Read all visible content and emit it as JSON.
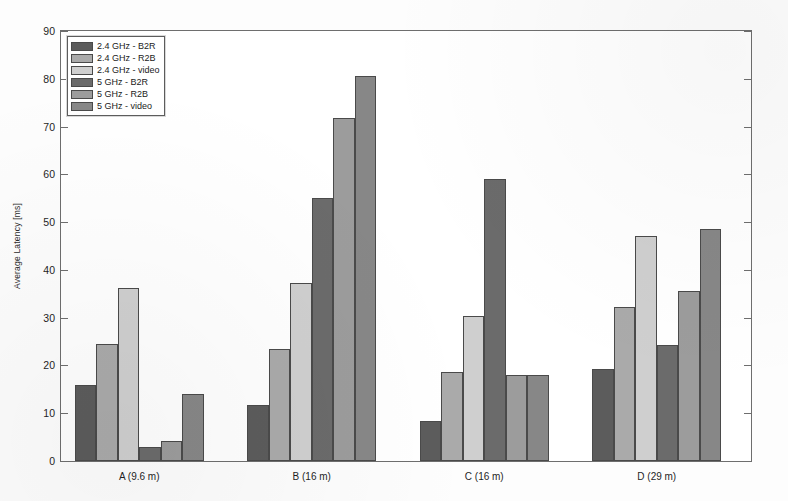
{
  "chart_data": {
    "type": "bar",
    "title": "",
    "xlabel": "",
    "ylabel": "Average Latency [ms]",
    "ylim": [
      0,
      90
    ],
    "yticks": [
      0,
      10,
      20,
      30,
      40,
      50,
      60,
      70,
      80,
      90
    ],
    "ytick_labels": [
      "0",
      "10",
      "20",
      "30",
      "40",
      "50",
      "60",
      "70",
      "80",
      "90"
    ],
    "grid": false,
    "legend_position": "upper left",
    "categories": [
      "A (9.6 m)",
      "B (16 m)",
      "C (16 m)",
      "D (29 m)"
    ],
    "series": [
      {
        "name": "2.4 GHz - B2R",
        "color": "#5c5c5c",
        "values": [
          16.0,
          11.7,
          8.3,
          19.2
        ]
      },
      {
        "name": "2.4 GHz - R2B",
        "color": "#aaaaaa",
        "values": [
          24.4,
          23.5,
          18.7,
          32.3
        ]
      },
      {
        "name": "2.4 GHz - video",
        "color": "#cfcfcf",
        "values": [
          36.2,
          37.3,
          30.3,
          47.0
        ]
      },
      {
        "name": "5 GHz - B2R",
        "color": "#6b6b6b",
        "values": [
          2.9,
          55.0,
          59.0,
          24.2
        ]
      },
      {
        "name": "5 GHz - R2B",
        "color": "#9c9c9c",
        "values": [
          4.1,
          71.8,
          18.1,
          35.6
        ]
      },
      {
        "name": "5 GHz - video",
        "color": "#878787",
        "values": [
          14.0,
          80.5,
          18.1,
          48.5
        ]
      }
    ]
  },
  "legend": {
    "items": [
      {
        "label": "2.4 GHz - B2R"
      },
      {
        "label": "2.4 GHz - R2B"
      },
      {
        "label": "2.4 GHz - video"
      },
      {
        "label": "5 GHz - B2R"
      },
      {
        "label": "5 GHz - R2B"
      },
      {
        "label": "5 GHz - video"
      }
    ]
  },
  "axes": {
    "y_label": "Average Latency [ms]",
    "y_tick_labels": [
      "90",
      "80",
      "70",
      "60",
      "50",
      "40",
      "30",
      "20",
      "10",
      "0"
    ],
    "x_tick_labels": [
      "A (9.6 m)",
      "B (16 m)",
      "C (16 m)",
      "D (29 m)"
    ]
  }
}
